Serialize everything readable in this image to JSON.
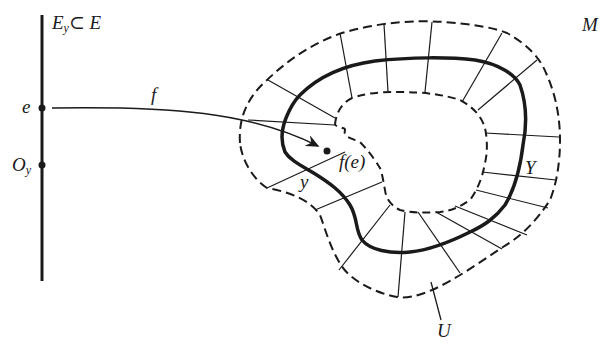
{
  "diagram": {
    "labels": {
      "fiber": "E",
      "fiber_sub": "y",
      "fiber_rest": "⊂ E",
      "manifold": "M",
      "point_e": "e",
      "origin": "O",
      "origin_sub": "y",
      "map": "f",
      "image_point": "f(e)",
      "point_y": "y",
      "submanifold": "Y",
      "neighborhood": "U"
    },
    "colors": {
      "ink": "#1a1a1a",
      "background": "#ffffff"
    }
  }
}
